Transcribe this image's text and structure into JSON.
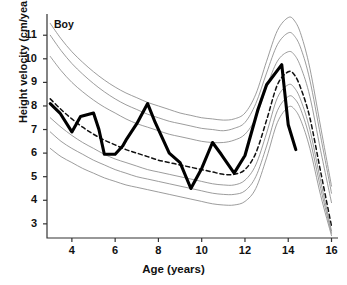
{
  "chart_data": {
    "type": "line",
    "title": "",
    "annotation": "Boy",
    "xlabel": "Age (years)",
    "ylabel": "Height velocity (cm/year)",
    "xlim": [
      2.85,
      16.3
    ],
    "ylim": [
      2.4,
      11.9
    ],
    "xticks": [
      4,
      6,
      8,
      10,
      12,
      14,
      16
    ],
    "xtick_labels": [
      "4",
      "6",
      "8",
      "10",
      "12",
      "14",
      "16"
    ],
    "yticks": [
      3,
      4,
      5,
      6,
      7,
      8,
      9,
      10,
      11
    ],
    "ytick_labels": [
      "3",
      "4",
      "5",
      "6",
      "7",
      "8",
      "9",
      "10",
      "11"
    ],
    "grid": false,
    "legend_position": "none",
    "reference_curve_color": "#8a8a8a",
    "median_curve_color": "#111111",
    "subject_curve_color": "#000000",
    "series": [
      {
        "name": "97th centile",
        "style": "thin-solid",
        "x": [
          3.0,
          3.5,
          4.0,
          4.5,
          5.0,
          5.5,
          6.0,
          6.5,
          7.0,
          7.5,
          8.0,
          8.5,
          9.0,
          9.5,
          10.0,
          10.5,
          11.0,
          11.5,
          12.0,
          12.5,
          13.0,
          13.5,
          14.0,
          14.3,
          14.6,
          15.0,
          15.5,
          16.0
        ],
        "values": [
          11.5,
          10.85,
          10.3,
          9.85,
          9.45,
          9.1,
          8.8,
          8.55,
          8.35,
          8.15,
          8.0,
          7.85,
          7.7,
          7.6,
          7.5,
          7.45,
          7.4,
          7.45,
          7.7,
          8.5,
          9.9,
          11.2,
          11.75,
          11.6,
          11.0,
          9.6,
          7.1,
          4.6
        ]
      },
      {
        "name": "90th centile",
        "style": "thin-solid",
        "x": [
          3.0,
          3.5,
          4.0,
          4.5,
          5.0,
          5.5,
          6.0,
          6.5,
          7.0,
          7.5,
          8.0,
          8.5,
          9.0,
          9.5,
          10.0,
          10.5,
          11.0,
          11.5,
          12.0,
          12.5,
          13.0,
          13.5,
          14.0,
          14.3,
          14.6,
          15.0,
          15.5,
          16.0
        ],
        "values": [
          11.0,
          10.35,
          9.8,
          9.35,
          8.95,
          8.6,
          8.3,
          8.05,
          7.85,
          7.65,
          7.5,
          7.35,
          7.25,
          7.15,
          7.05,
          7.0,
          6.95,
          7.05,
          7.3,
          8.1,
          9.4,
          10.6,
          11.1,
          10.95,
          10.4,
          9.1,
          6.7,
          4.3
        ]
      },
      {
        "name": "75th centile",
        "style": "thin-solid",
        "x": [
          3.0,
          3.5,
          4.0,
          4.5,
          5.0,
          5.5,
          6.0,
          6.5,
          7.0,
          7.5,
          8.0,
          8.5,
          9.0,
          9.5,
          10.0,
          10.5,
          11.0,
          11.5,
          12.0,
          12.5,
          13.0,
          13.5,
          14.0,
          14.3,
          14.6,
          15.0,
          15.5,
          16.0
        ],
        "values": [
          10.1,
          9.5,
          9.0,
          8.6,
          8.25,
          7.95,
          7.7,
          7.45,
          7.25,
          7.1,
          6.95,
          6.8,
          6.7,
          6.6,
          6.5,
          6.45,
          6.45,
          6.55,
          6.8,
          7.5,
          8.8,
          9.9,
          10.3,
          10.15,
          9.6,
          8.4,
          6.1,
          3.9
        ]
      },
      {
        "name": "50th centile (median)",
        "style": "dashed",
        "x": [
          3.0,
          3.5,
          4.0,
          4.5,
          5.0,
          5.5,
          6.0,
          6.5,
          7.0,
          7.5,
          8.0,
          8.5,
          9.0,
          9.5,
          10.0,
          10.5,
          11.0,
          11.5,
          12.0,
          12.5,
          13.0,
          13.5,
          14.0,
          14.3,
          14.6,
          15.0,
          15.5,
          16.0
        ],
        "values": [
          8.3,
          7.85,
          7.45,
          7.1,
          6.8,
          6.55,
          6.35,
          6.15,
          6.0,
          5.85,
          5.7,
          5.6,
          5.5,
          5.4,
          5.3,
          5.2,
          5.1,
          5.1,
          5.3,
          6.0,
          7.4,
          8.9,
          9.45,
          9.3,
          8.7,
          7.5,
          5.2,
          2.9
        ]
      },
      {
        "name": "25th centile",
        "style": "thin-solid",
        "x": [
          3.0,
          3.5,
          4.0,
          4.5,
          5.0,
          5.5,
          6.0,
          6.5,
          7.0,
          7.5,
          8.0,
          8.5,
          9.0,
          9.5,
          10.0,
          10.5,
          11.0,
          11.5,
          12.0,
          12.5,
          13.0,
          13.5,
          14.0,
          14.3,
          14.6,
          15.0,
          15.5,
          16.0
        ],
        "values": [
          7.5,
          7.1,
          6.75,
          6.45,
          6.2,
          5.95,
          5.75,
          5.6,
          5.45,
          5.3,
          5.2,
          5.1,
          5.0,
          4.9,
          4.8,
          4.7,
          4.65,
          4.65,
          4.85,
          5.5,
          6.85,
          8.35,
          8.9,
          8.75,
          8.2,
          7.0,
          4.8,
          2.7
        ]
      },
      {
        "name": "10th centile",
        "style": "thin-solid",
        "x": [
          3.0,
          3.5,
          4.0,
          4.5,
          5.0,
          5.5,
          6.0,
          6.5,
          7.0,
          7.5,
          8.0,
          8.5,
          9.0,
          9.5,
          10.0,
          10.5,
          11.0,
          11.5,
          12.0,
          12.5,
          13.0,
          13.5,
          14.0,
          14.3,
          14.6,
          15.0,
          15.5,
          16.0
        ],
        "values": [
          6.9,
          6.5,
          6.2,
          5.95,
          5.7,
          5.5,
          5.3,
          5.15,
          5.0,
          4.9,
          4.8,
          4.7,
          4.6,
          4.5,
          4.4,
          4.3,
          4.25,
          4.25,
          4.4,
          5.0,
          6.3,
          7.8,
          8.4,
          8.3,
          7.8,
          6.6,
          4.5,
          2.6
        ]
      },
      {
        "name": "3rd centile",
        "style": "thin-solid",
        "x": [
          3.0,
          3.5,
          4.0,
          4.5,
          5.0,
          5.5,
          6.0,
          6.5,
          7.0,
          7.5,
          8.0,
          8.5,
          9.0,
          9.5,
          10.0,
          10.5,
          11.0,
          11.5,
          12.0,
          12.5,
          13.0,
          13.5,
          14.0,
          14.3,
          14.6,
          15.0,
          15.5,
          16.0
        ],
        "values": [
          6.2,
          5.85,
          5.6,
          5.35,
          5.15,
          4.95,
          4.8,
          4.65,
          4.55,
          4.45,
          4.35,
          4.25,
          4.15,
          4.05,
          3.95,
          3.85,
          3.8,
          3.8,
          3.95,
          4.5,
          5.8,
          7.3,
          7.95,
          7.85,
          7.35,
          6.2,
          4.2,
          2.5
        ]
      },
      {
        "name": "Individual boy measurements",
        "style": "thick-solid",
        "x": [
          3.0,
          3.45,
          4.0,
          4.4,
          5.0,
          5.25,
          5.5,
          6.0,
          6.35,
          6.5,
          7.0,
          7.5,
          7.85,
          8.5,
          9.0,
          9.5,
          10.0,
          10.5,
          10.9,
          11.5,
          12.0,
          12.6,
          13.0,
          13.7,
          14.0,
          14.35
        ],
        "values": [
          8.1,
          7.7,
          6.9,
          7.55,
          7.7,
          7.0,
          5.95,
          5.95,
          6.3,
          6.55,
          7.25,
          8.1,
          7.3,
          6.0,
          5.6,
          4.5,
          5.35,
          6.45,
          5.95,
          5.15,
          5.9,
          7.85,
          8.9,
          9.75,
          7.2,
          6.15
        ]
      }
    ]
  }
}
